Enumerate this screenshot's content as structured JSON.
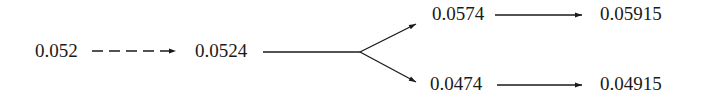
{
  "diagram": {
    "nodes": [
      {
        "id": "n0",
        "label": "0.052"
      },
      {
        "id": "n1",
        "label": "0.0524"
      },
      {
        "id": "n2",
        "label": "0.0574"
      },
      {
        "id": "n3",
        "label": "0.05915"
      },
      {
        "id": "n4",
        "label": "0.0474"
      },
      {
        "id": "n5",
        "label": "0.04915"
      }
    ],
    "edges": [
      {
        "from": "0.052",
        "to": "0.0524",
        "style": "dashed"
      },
      {
        "from": "0.0524",
        "to": "0.0574",
        "style": "solid-branch"
      },
      {
        "from": "0.0524",
        "to": "0.0474",
        "style": "solid-branch"
      },
      {
        "from": "0.0574",
        "to": "0.05915",
        "style": "solid"
      },
      {
        "from": "0.0474",
        "to": "0.04915",
        "style": "solid"
      }
    ],
    "stroke_color": "#1a1a1a"
  }
}
